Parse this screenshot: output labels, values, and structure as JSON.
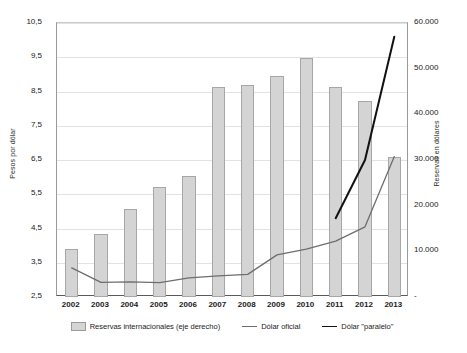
{
  "chart_data": {
    "type": "bar",
    "title": "",
    "xlabel": "",
    "ylabel": "Pesos por dólar",
    "y2label": "Reservas en dólares",
    "categories": [
      "2002",
      "2003",
      "2004",
      "2005",
      "2006",
      "2007",
      "2008",
      "2009",
      "2010",
      "2011",
      "2012",
      "2013"
    ],
    "ylim": [
      2.5,
      10.5
    ],
    "y2lim": [
      0,
      60000
    ],
    "yticks": [
      "2,5",
      "3,5",
      "4,5",
      "5,5",
      "6,5",
      "7,5",
      "8,5",
      "9,5",
      "10,5"
    ],
    "ytick_values": [
      2.5,
      3.5,
      4.5,
      5.5,
      6.5,
      7.5,
      8.5,
      9.5,
      10.5
    ],
    "y2ticks": [
      "-",
      "10.000",
      "20.000",
      "30.000",
      "40.000",
      "50.000",
      "60.000"
    ],
    "y2tick_values": [
      0,
      10000,
      20000,
      30000,
      40000,
      50000,
      60000
    ],
    "grid": true,
    "legend_position": "bottom",
    "series": [
      {
        "name": "Reservas internacionales (eje derecho)",
        "type": "bar",
        "axis": "right",
        "color": "#d4d4d4",
        "values": [
          10500,
          13800,
          19300,
          24000,
          26600,
          46000,
          46400,
          48300,
          52300,
          46000,
          43000,
          30600
        ]
      },
      {
        "name": "Dólar oficial",
        "type": "line",
        "axis": "left",
        "color": "#6e6e6e",
        "values": [
          3.35,
          2.93,
          2.94,
          2.92,
          3.06,
          3.12,
          3.16,
          3.73,
          3.9,
          4.13,
          4.55,
          6.6
        ]
      },
      {
        "name": "Dólar \"paralelo\"",
        "type": "line",
        "axis": "left",
        "color": "#111111",
        "values": [
          null,
          null,
          null,
          null,
          null,
          null,
          null,
          null,
          null,
          4.8,
          6.5,
          10.1
        ]
      }
    ]
  },
  "legend": {
    "items": [
      {
        "label": "Reservas internacionales (eje derecho)",
        "kind": "bar"
      },
      {
        "label": "Dólar oficial",
        "kind": "line"
      },
      {
        "label": "Dólar \"paralelo\"",
        "kind": "line-dark"
      }
    ]
  }
}
